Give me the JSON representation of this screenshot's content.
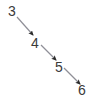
{
  "figure": {
    "type": "chain-diagram",
    "background_color": "#ffffff",
    "width": 91,
    "height": 99
  },
  "nodes": [
    {
      "label": "3",
      "x": 8,
      "y": 4
    },
    {
      "label": "4",
      "x": 31,
      "y": 36
    },
    {
      "label": "5",
      "x": 55,
      "y": 60
    },
    {
      "label": "6",
      "x": 78,
      "y": 83
    }
  ],
  "edges": [
    {
      "from": "3",
      "to": "4",
      "x1": 17,
      "y1": 17,
      "x2": 33,
      "y2": 35
    },
    {
      "from": "4",
      "to": "5",
      "x1": 41,
      "y1": 45,
      "x2": 56,
      "y2": 60
    },
    {
      "from": "5",
      "to": "6",
      "x1": 64,
      "y1": 68,
      "x2": 80,
      "y2": 84
    }
  ],
  "style": {
    "edge_color": "#8f8f97",
    "arrowhead_color": "#2b2b2b",
    "label_color": "#3a3a3a",
    "edge_width": 1.2
  }
}
